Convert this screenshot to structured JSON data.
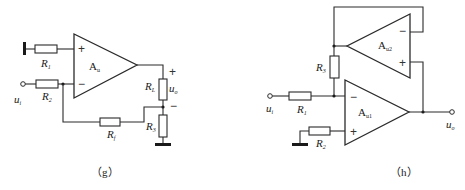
{
  "figures": [
    {
      "id": "g",
      "caption": "（g）",
      "opamp": {
        "name": "A",
        "sub": "u",
        "plus": "+",
        "minus": "−"
      },
      "resistors": {
        "R1": {
          "name": "R",
          "sub": "1"
        },
        "R2": {
          "name": "R",
          "sub": "2"
        },
        "RL": {
          "name": "R",
          "sub": "L"
        },
        "R3": {
          "name": "R",
          "sub": "3"
        },
        "Rf": {
          "name": "R",
          "sub": "f"
        }
      },
      "input": {
        "name": "u",
        "sub": "i"
      },
      "output": {
        "name": "u",
        "sub": "o",
        "plus": "+",
        "minus": "−"
      }
    },
    {
      "id": "h",
      "caption": "（h）",
      "opamp1": {
        "name": "A",
        "sub": "u1",
        "plus": "+",
        "minus": "−"
      },
      "opamp2": {
        "name": "A",
        "sub": "u2",
        "plus": "+",
        "minus": "−"
      },
      "resistors": {
        "R1": {
          "name": "R",
          "sub": "1"
        },
        "R2": {
          "name": "R",
          "sub": "2"
        },
        "R3": {
          "name": "R",
          "sub": "3"
        }
      },
      "input": {
        "name": "u",
        "sub": "i"
      },
      "output": {
        "name": "u",
        "sub": "o"
      }
    }
  ]
}
